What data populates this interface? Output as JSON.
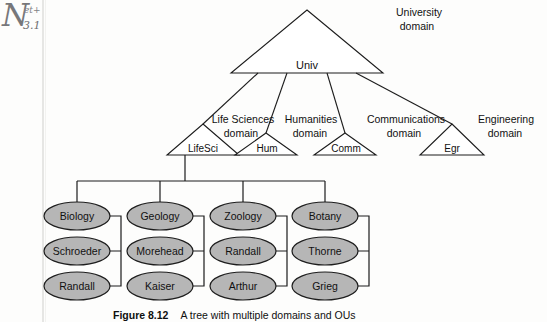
{
  "margin_note": {
    "base": "N",
    "superscript": "et+",
    "subscript": "3.1"
  },
  "caption": {
    "figure_number": "Figure 8.12",
    "text": "A tree with multiple domains and OUs"
  },
  "diagram": {
    "type": "tree",
    "root": {
      "name": "Univ",
      "domain_label_line1": "University",
      "domain_label_line2": "domain"
    },
    "domains": [
      {
        "name": "LifeSci",
        "domain_label_line1": "Life Sciences",
        "domain_label_line2": "domain"
      },
      {
        "name": "Hum",
        "domain_label_line1": "Humanities",
        "domain_label_line2": "domain"
      },
      {
        "name": "Comm",
        "domain_label_line1": "Communications",
        "domain_label_line2": "domain"
      },
      {
        "name": "Egr",
        "domain_label_line1": "Engineering",
        "domain_label_line2": "domain"
      }
    ],
    "ou_columns": [
      {
        "parent": "LifeSci",
        "nodes": [
          "Biology",
          "Schroeder",
          "Randall"
        ]
      },
      {
        "parent": "LifeSci",
        "nodes": [
          "Geology",
          "Morehead",
          "Kaiser"
        ]
      },
      {
        "parent": "LifeSci",
        "nodes": [
          "Zoology",
          "Randall",
          "Arthur"
        ]
      },
      {
        "parent": "LifeSci",
        "nodes": [
          "Botany",
          "Thorne",
          "Grieg"
        ]
      }
    ],
    "colors": {
      "ou_fill": "#b6b6b6",
      "stroke": "#1c1c1c",
      "triangle_fill": "#ffffff",
      "background": "#fdfdfc"
    }
  }
}
